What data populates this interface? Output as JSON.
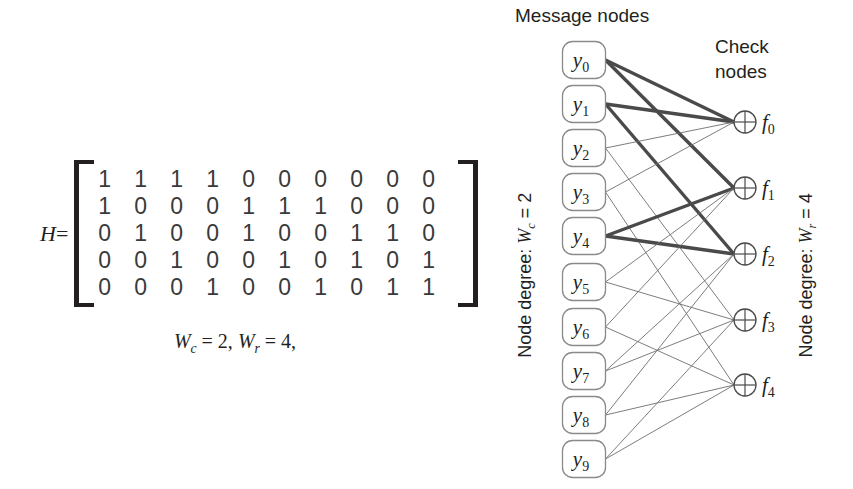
{
  "matrix": {
    "label": "H",
    "equals": "=",
    "rows": [
      [
        1,
        1,
        1,
        1,
        0,
        0,
        0,
        0,
        0,
        0
      ],
      [
        1,
        0,
        0,
        0,
        1,
        1,
        1,
        0,
        0,
        0
      ],
      [
        0,
        1,
        0,
        0,
        1,
        0,
        0,
        1,
        1,
        0
      ],
      [
        0,
        0,
        1,
        0,
        0,
        1,
        0,
        1,
        0,
        1
      ],
      [
        0,
        0,
        0,
        1,
        0,
        0,
        1,
        0,
        1,
        1
      ]
    ],
    "caption": "Wc = 2, Wr = 4,",
    "caption_parts": {
      "wc_symbol": "W",
      "wc_sub": "c",
      "wc_value": "= 2,",
      "wr_symbol": "W",
      "wr_sub": "r",
      "wr_value": "= 4,"
    }
  },
  "graph": {
    "message_nodes_title": "Message nodes",
    "check_nodes_title": "Check\nnodes",
    "left_degree_label": {
      "prefix": "Node degree:  ",
      "symbol": "W",
      "sub": "c",
      "value": " = 2"
    },
    "right_degree_label": {
      "prefix": "Node degree:  ",
      "symbol": "W",
      "sub": "r",
      "value": " = 4"
    },
    "message_nodes": [
      {
        "id": "y0",
        "symbol": "y",
        "sub": "0",
        "x": 84,
        "y": 60
      },
      {
        "id": "y1",
        "symbol": "y",
        "sub": "1",
        "x": 84,
        "y": 104
      },
      {
        "id": "y2",
        "symbol": "y",
        "sub": "2",
        "x": 84,
        "y": 148
      },
      {
        "id": "y3",
        "symbol": "y",
        "sub": "3",
        "x": 84,
        "y": 192
      },
      {
        "id": "y4",
        "symbol": "y",
        "sub": "4",
        "x": 84,
        "y": 236
      },
      {
        "id": "y5",
        "symbol": "y",
        "sub": "5",
        "x": 84,
        "y": 282
      },
      {
        "id": "y6",
        "symbol": "y",
        "sub": "6",
        "x": 84,
        "y": 327
      },
      {
        "id": "y7",
        "symbol": "y",
        "sub": "7",
        "x": 84,
        "y": 371
      },
      {
        "id": "y8",
        "symbol": "y",
        "sub": "8",
        "x": 84,
        "y": 415
      },
      {
        "id": "y9",
        "symbol": "y",
        "sub": "9",
        "x": 84,
        "y": 459
      }
    ],
    "check_nodes": [
      {
        "id": "f0",
        "symbol": "f",
        "sub": "0",
        "x": 245,
        "y": 122
      },
      {
        "id": "f1",
        "symbol": "f",
        "sub": "1",
        "x": 245,
        "y": 188
      },
      {
        "id": "f2",
        "symbol": "f",
        "sub": "2",
        "x": 245,
        "y": 254
      },
      {
        "id": "f3",
        "symbol": "f",
        "sub": "3",
        "x": 245,
        "y": 320
      },
      {
        "id": "f4",
        "symbol": "f",
        "sub": "4",
        "x": 245,
        "y": 385
      }
    ],
    "check_node_glyph": "circled-plus",
    "edges": [
      {
        "from": "y0",
        "to": "f0",
        "bold": true
      },
      {
        "from": "y0",
        "to": "f1",
        "bold": true
      },
      {
        "from": "y1",
        "to": "f0",
        "bold": true
      },
      {
        "from": "y1",
        "to": "f2",
        "bold": true
      },
      {
        "from": "y2",
        "to": "f0",
        "bold": false
      },
      {
        "from": "y2",
        "to": "f3",
        "bold": false
      },
      {
        "from": "y3",
        "to": "f0",
        "bold": false
      },
      {
        "from": "y3",
        "to": "f4",
        "bold": false
      },
      {
        "from": "y4",
        "to": "f1",
        "bold": true
      },
      {
        "from": "y4",
        "to": "f2",
        "bold": true
      },
      {
        "from": "y5",
        "to": "f1",
        "bold": false
      },
      {
        "from": "y5",
        "to": "f3",
        "bold": false
      },
      {
        "from": "y6",
        "to": "f1",
        "bold": false
      },
      {
        "from": "y6",
        "to": "f4",
        "bold": false
      },
      {
        "from": "y7",
        "to": "f2",
        "bold": false
      },
      {
        "from": "y7",
        "to": "f3",
        "bold": false
      },
      {
        "from": "y8",
        "to": "f2",
        "bold": false
      },
      {
        "from": "y8",
        "to": "f4",
        "bold": false
      },
      {
        "from": "y9",
        "to": "f3",
        "bold": false
      },
      {
        "from": "y9",
        "to": "f4",
        "bold": false
      }
    ]
  },
  "colors": {
    "ink": "#231f20",
    "edge_light": "#6e6e6e",
    "edge_bold": "#4a4a4a",
    "node_stroke": "#8a8a8a",
    "background": "#ffffff"
  }
}
